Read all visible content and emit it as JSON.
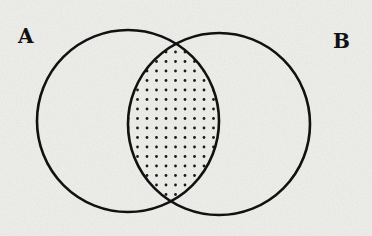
{
  "diagram": {
    "type": "venn",
    "sets": [
      {
        "label": "A",
        "cx": 128,
        "cy": 121,
        "r": 91
      },
      {
        "label": "B",
        "cx": 219,
        "cy": 124,
        "r": 91
      }
    ],
    "shaded_region": "A ∩ B",
    "shading_pattern": "dots",
    "colors": {
      "background": "#efefec",
      "stroke": "#111111",
      "dots": "#1a1a1a"
    }
  },
  "labels": {
    "set_a": "A",
    "set_b": "B"
  }
}
